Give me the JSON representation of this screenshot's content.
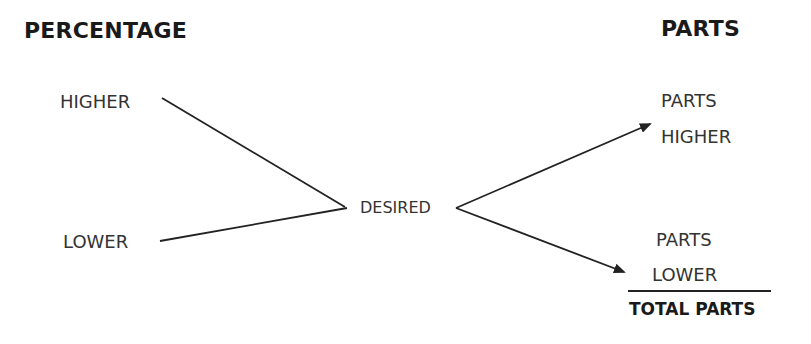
{
  "headers": {
    "left": "PERCENTAGE",
    "right": "PARTS"
  },
  "left_nodes": {
    "higher": "HIGHER",
    "lower": "LOWER"
  },
  "center_node": "DESIRED",
  "right_nodes": {
    "parts_higher_line1": "PARTS",
    "parts_higher_line2": "HIGHER",
    "parts_lower_line1": "PARTS",
    "parts_lower_line2": "LOWER",
    "total": "TOTAL PARTS"
  },
  "colors": {
    "line": "#222222",
    "text": "#333333",
    "heading": "#1a1a1a"
  }
}
